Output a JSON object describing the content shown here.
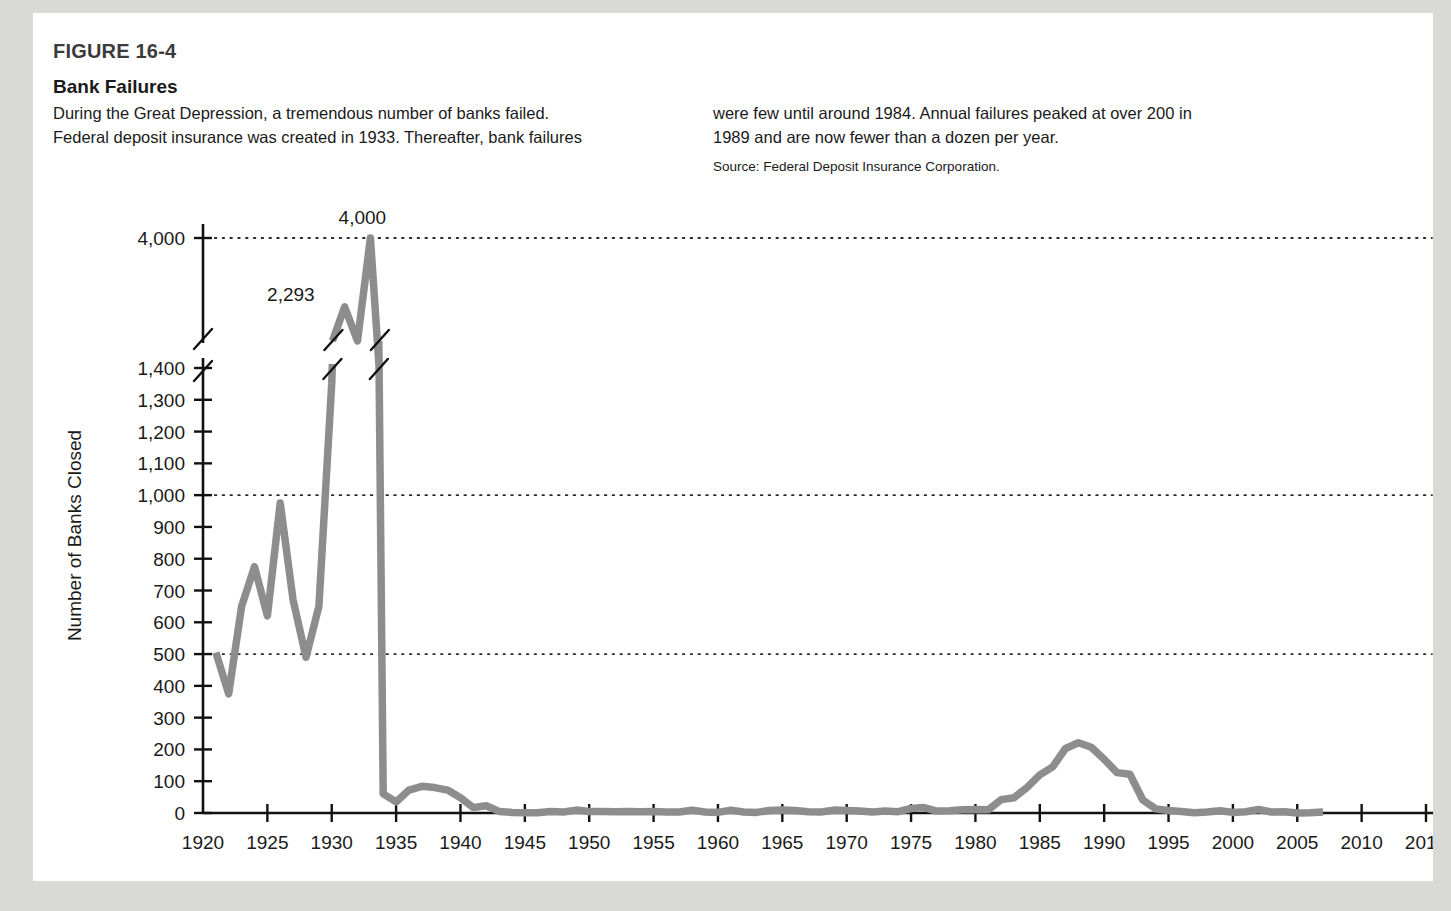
{
  "figure": {
    "number": "FIGURE 16-4",
    "title": "Bank Failures",
    "caption_left_line1": "During the Great Depression, a tremendous number of banks failed.",
    "caption_left_line2": "Federal deposit insurance was created in 1933. Thereafter, bank failures",
    "caption_right_line1": "were few until around 1984. Annual failures peaked at over 200 in",
    "caption_right_line2": "1989 and are now fewer than a dozen per year.",
    "source": "Source: Federal Deposit Insurance Corporation."
  },
  "colors": {
    "line": "#8d8d8d",
    "axis": "#111111",
    "grid": "#2a2a2a",
    "text": "#1a1a1a",
    "figure_bg": "#ffffff",
    "page_bg": "#d9d9d6"
  },
  "chart_data": {
    "type": "line",
    "title": "Bank Failures",
    "xlabel": "Year",
    "ylabel": "Number of Banks Closed",
    "xlim": [
      1920,
      2015
    ],
    "ylim": [
      0,
      4000
    ],
    "grid": true,
    "gridlines_y": [
      500,
      1000,
      4000
    ],
    "legend": "none",
    "axis_break": {
      "present": true,
      "below": 1400,
      "above": 4000,
      "note": "y-axis broken between 1,400 and 4,000"
    },
    "xticks": [
      1920,
      1925,
      1930,
      1935,
      1940,
      1945,
      1950,
      1955,
      1960,
      1965,
      1970,
      1975,
      1980,
      1985,
      1990,
      1995,
      2000,
      2005,
      2010,
      2015
    ],
    "yticks": [
      0,
      100,
      200,
      300,
      400,
      500,
      600,
      700,
      800,
      900,
      1000,
      1100,
      1200,
      1300,
      1400,
      4000
    ],
    "ytick_labels": [
      "0",
      "100",
      "200",
      "300",
      "400",
      "500",
      "600",
      "700",
      "800",
      "900",
      "1,000",
      "1,100",
      "1,200",
      "1,300",
      "1,400",
      "4,000"
    ],
    "annotations": [
      {
        "text": "4,000",
        "year": 1933,
        "value": 4000
      },
      {
        "text": "2,293",
        "year": 1931,
        "value": 2293
      }
    ],
    "series": [
      {
        "name": "Number of Banks Closed",
        "x": [
          1921,
          1922,
          1923,
          1924,
          1925,
          1926,
          1927,
          1928,
          1929,
          1930,
          1931,
          1932,
          1933,
          1934,
          1935,
          1936,
          1937,
          1938,
          1939,
          1940,
          1941,
          1942,
          1943,
          1944,
          1945,
          1946,
          1947,
          1948,
          1949,
          1950,
          1951,
          1952,
          1953,
          1954,
          1955,
          1956,
          1957,
          1958,
          1959,
          1960,
          1961,
          1962,
          1963,
          1964,
          1965,
          1966,
          1967,
          1968,
          1969,
          1970,
          1971,
          1972,
          1973,
          1974,
          1975,
          1976,
          1977,
          1978,
          1979,
          1980,
          1981,
          1982,
          1983,
          1984,
          1985,
          1986,
          1987,
          1988,
          1989,
          1990,
          1991,
          1992,
          1993,
          1994,
          1995,
          1996,
          1997,
          1998,
          1999,
          2000,
          2001,
          2002,
          2003,
          2004,
          2005,
          2006,
          2007
        ],
        "values": [
          505,
          375,
          650,
          775,
          620,
          975,
          670,
          490,
          650,
          1350,
          2293,
          1453,
          4000,
          60,
          35,
          72,
          84,
          80,
          72,
          48,
          17,
          23,
          5,
          2,
          1,
          1,
          5,
          3,
          9,
          5,
          5,
          4,
          5,
          4,
          5,
          3,
          3,
          9,
          3,
          2,
          9,
          3,
          2,
          8,
          9,
          8,
          4,
          3,
          9,
          8,
          6,
          3,
          6,
          4,
          14,
          17,
          6,
          7,
          10,
          11,
          10,
          42,
          48,
          80,
          120,
          145,
          203,
          221,
          207,
          169,
          127,
          122,
          41,
          13,
          8,
          5,
          1,
          3,
          7,
          2,
          4,
          11,
          3,
          4,
          0,
          1,
          3
        ]
      }
    ]
  }
}
